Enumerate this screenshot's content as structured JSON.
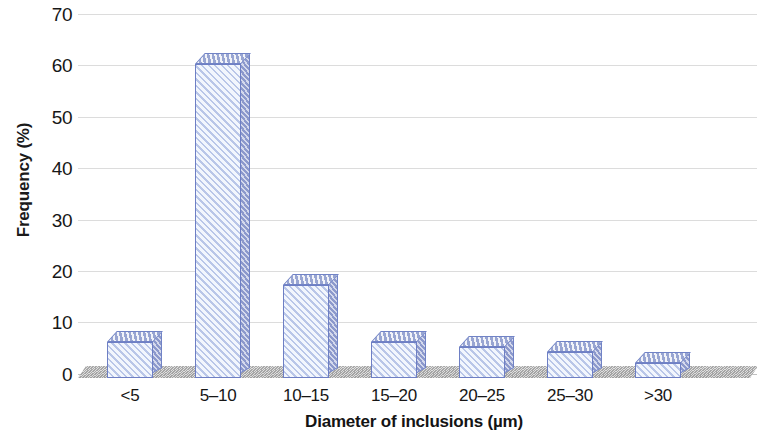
{
  "chart_data": {
    "type": "bar",
    "title": "",
    "xlabel": "Diameter of inclusions (µm)",
    "ylabel": "Frequency (%)",
    "categories": [
      "<5",
      "5–10",
      "10–15",
      "15–20",
      "20–25",
      "25–30",
      ">30"
    ],
    "values": [
      7,
      61,
      18,
      7,
      6,
      5,
      3
    ],
    "ylim": [
      0,
      70
    ],
    "ytick_labels": [
      "0",
      "10",
      "20",
      "30",
      "40",
      "50",
      "60",
      "70"
    ],
    "ytick_values": [
      0,
      10,
      20,
      30,
      40,
      50,
      60,
      70
    ],
    "grid": true,
    "legend": "none",
    "style": "3d-hatched-bars",
    "colors": {
      "bar_fill": "#f2f6fd",
      "bar_hatch": "#b9c6e8",
      "bar_outline": "#6e7fc4",
      "bar_top_face": "#c3cbe6",
      "bar_side_face": "#a9b3da",
      "gridline": "#cfcfcf",
      "floor": "#bdbdbd",
      "text": "#161616",
      "background": "#ffffff"
    }
  }
}
